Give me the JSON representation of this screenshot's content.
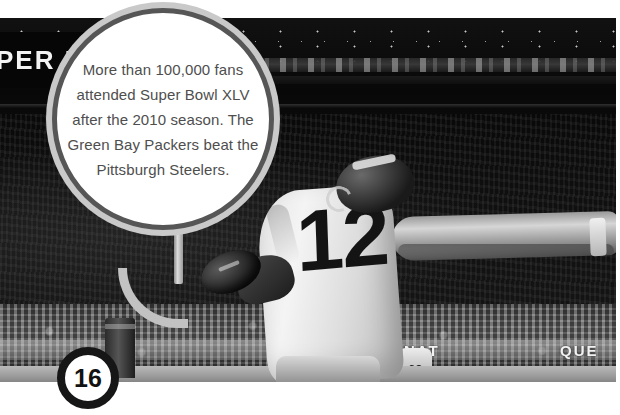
{
  "page": {
    "number": "16",
    "background_color": "#ffffff"
  },
  "callout": {
    "text": "More than 100,000 fans attended Super Bowl XLV after the 2010 season. The Green Bay Packers beat the Pittsburgh Steelers.",
    "lines": [
      "More than",
      "100,000 fans",
      "attended Super Bowl",
      "XLV after the 2010",
      "season. The Green",
      "Bay Packers beat the",
      "Pittsburgh Steelers."
    ],
    "text_color": "#4e4e4e",
    "fill_color": "#ffffff",
    "ring_color": "#565656",
    "outer_ring_color": "#c9c9c9",
    "tail_color": "#6d6d6d"
  },
  "photo": {
    "description": "Black and white photograph of an American football player in a white jersey leaping to catch a football in the end zone of a packed stadium",
    "alt": "Football player catching pass near goalpost",
    "jersey_number": "12",
    "stadium_sign_text": "PER F",
    "background_player_number": "68",
    "ad_text_left": "NAT",
    "ad_text_right": "QUE"
  }
}
